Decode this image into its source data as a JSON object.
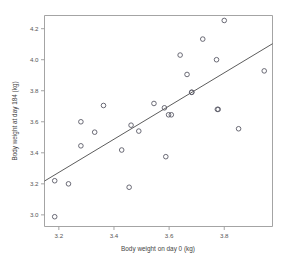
{
  "chart_data": {
    "type": "scatter",
    "title": "",
    "xlabel": "Body weight on day 0 (kg)",
    "ylabel": "Body weight at day 184 (kg)",
    "xlim": [
      3.148,
      3.975
    ],
    "ylim": [
      2.925,
      4.285
    ],
    "xticks": [
      3.2,
      3.4,
      3.6,
      3.8
    ],
    "xtick_labels": [
      "3.2",
      "3.4",
      "3.6",
      "3.8"
    ],
    "yticks": [
      3.0,
      3.2,
      3.4,
      3.6,
      3.8,
      4.0,
      4.2
    ],
    "ytick_labels": [
      "3.0",
      "3.2",
      "3.4",
      "3.6",
      "3.8",
      "4.0",
      "4.2"
    ],
    "grid": false,
    "legend": false,
    "marker": "open-circle",
    "marker_color": "#5a5a66",
    "line_color": "#4a4a4a",
    "x": [
      3.185,
      3.185,
      3.235,
      3.28,
      3.28,
      3.33,
      3.362,
      3.428,
      3.455,
      3.462,
      3.49,
      3.545,
      3.583,
      3.588,
      3.598,
      3.608,
      3.64,
      3.665,
      3.682,
      3.682,
      3.722,
      3.772,
      3.775,
      3.778,
      3.8,
      3.852,
      3.945
    ],
    "y": [
      2.988,
      3.22,
      3.2,
      3.445,
      3.6,
      3.533,
      3.705,
      3.418,
      3.178,
      3.578,
      3.54,
      3.718,
      3.69,
      3.375,
      3.645,
      3.645,
      4.03,
      3.905,
      3.79,
      3.79,
      4.133,
      4.0,
      3.68,
      3.68,
      4.253,
      3.555,
      3.928
    ],
    "fit_line": {
      "x": [
        3.148,
        3.975
      ],
      "y": [
        3.218,
        4.103
      ],
      "label": "linear fit"
    }
  }
}
